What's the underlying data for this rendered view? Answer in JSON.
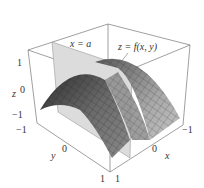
{
  "figure": {
    "surface_label": "z = f(x, y)",
    "plane_label": "x = a",
    "axes": {
      "z": {
        "label": "z",
        "ticks": [
          "1",
          "0",
          "−1"
        ]
      },
      "y": {
        "label": "y",
        "ticks": [
          "−1",
          "0",
          "1"
        ]
      },
      "x": {
        "label": "x",
        "ticks": [
          "1",
          "0",
          "−1"
        ]
      }
    },
    "colors": {
      "surface_dark": "#3a3a3a",
      "surface_mid": "#7a7a7a",
      "surface_light": "#b8b8b8",
      "plane": "#d9d9d9",
      "box_edge": "#777777"
    }
  }
}
